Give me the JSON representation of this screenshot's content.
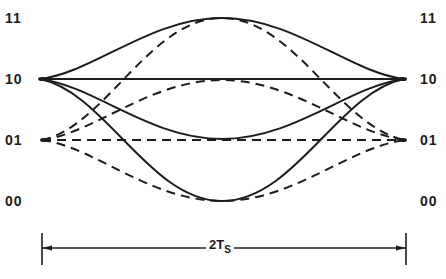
{
  "diagram": {
    "type": "eye-diagram-trajectories",
    "levels": [
      {
        "label": "11",
        "y": 18
      },
      {
        "label": "10",
        "y": 79
      },
      {
        "label": "01",
        "y": 140
      },
      {
        "label": "00",
        "y": 201
      }
    ],
    "left_labels": [
      "11",
      "10",
      "01",
      "00"
    ],
    "right_labels": [
      "11",
      "10",
      "01",
      "00"
    ],
    "solid_trajectories": [
      {
        "from": "10",
        "via": "11",
        "to": "10"
      },
      {
        "from": "10",
        "via": "10",
        "to": "10"
      },
      {
        "from": "10",
        "via": "01",
        "to": "10"
      },
      {
        "from": "10",
        "via": "00",
        "to": "10"
      }
    ],
    "dashed_trajectories": [
      {
        "from": "01",
        "via": "11",
        "to": "01"
      },
      {
        "from": "01",
        "via": "10",
        "to": "01"
      },
      {
        "from": "01",
        "via": "01",
        "to": "01"
      },
      {
        "from": "01",
        "via": "00",
        "to": "01"
      }
    ],
    "dimension": {
      "label_main": "2T",
      "label_sub": "S",
      "left_x": 42,
      "right_x": 406
    },
    "colors": {
      "line": "#1c1c1c",
      "background": "#ffffff"
    }
  }
}
